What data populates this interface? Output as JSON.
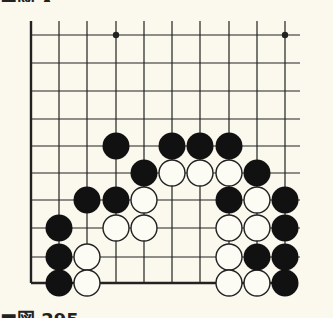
{
  "diagram": {
    "type": "go-board-problem",
    "colors": {
      "background": "#fbf9ee",
      "line": "#222222",
      "black_stone": "#111111",
      "white_stone_fill": "#fdfcf4",
      "white_stone_stroke": "#222222"
    },
    "grid": {
      "columns_x": [
        31,
        59,
        87,
        116,
        144,
        172,
        200,
        229,
        257,
        285
      ],
      "rows_y": [
        35,
        63,
        91,
        119,
        146,
        173,
        200,
        228,
        257,
        283
      ],
      "line_extend_top_y": 21,
      "line_extend_right_x": 300,
      "thick_edges": [
        "left",
        "bottom"
      ],
      "stone_radius": 13
    },
    "star_points": [
      {
        "col": 3,
        "row": 0
      },
      {
        "col": 9,
        "row": 0
      }
    ],
    "stones": {
      "black": [
        {
          "col": 3,
          "row": 4
        },
        {
          "col": 5,
          "row": 4
        },
        {
          "col": 6,
          "row": 4
        },
        {
          "col": 7,
          "row": 4
        },
        {
          "col": 4,
          "row": 5
        },
        {
          "col": 8,
          "row": 5
        },
        {
          "col": 2,
          "row": 6
        },
        {
          "col": 3,
          "row": 6
        },
        {
          "col": 7,
          "row": 6
        },
        {
          "col": 9,
          "row": 6
        },
        {
          "col": 1,
          "row": 7
        },
        {
          "col": 9,
          "row": 7
        },
        {
          "col": 1,
          "row": 8
        },
        {
          "col": 8,
          "row": 8
        },
        {
          "col": 9,
          "row": 8
        },
        {
          "col": 1,
          "row": 9
        },
        {
          "col": 9,
          "row": 9
        }
      ],
      "white": [
        {
          "col": 5,
          "row": 5
        },
        {
          "col": 6,
          "row": 5
        },
        {
          "col": 7,
          "row": 5
        },
        {
          "col": 4,
          "row": 6
        },
        {
          "col": 8,
          "row": 6
        },
        {
          "col": 3,
          "row": 7
        },
        {
          "col": 4,
          "row": 7
        },
        {
          "col": 7,
          "row": 7
        },
        {
          "col": 8,
          "row": 7
        },
        {
          "col": 2,
          "row": 8
        },
        {
          "col": 7,
          "row": 8
        },
        {
          "col": 2,
          "row": 9
        },
        {
          "col": 7,
          "row": 9
        },
        {
          "col": 8,
          "row": 9
        }
      ]
    },
    "cut_text": {
      "top": "■図 •",
      "bottom": "■図 295 …"
    }
  }
}
